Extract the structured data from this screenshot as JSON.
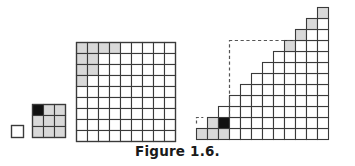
{
  "figure": {
    "caption": "Figure 1.6.",
    "background_color": "#ffffff",
    "line_color": "#3a3a3a",
    "shaded_color": "#d9d9d9",
    "black_color": "#111111",
    "empty_color": "#ffffff",
    "dashed_color": "#555555",
    "panels": [
      {
        "id": "panel-1",
        "name": "single-square-panel",
        "label": "n = 1",
        "type": "grid",
        "cols": 1,
        "rows": 1,
        "cell_px": 12,
        "origin_x": 11,
        "origin_y": 125,
        "shaded_cells": [],
        "black_cells": [],
        "cell_count": 1
      },
      {
        "id": "panel-2",
        "name": "three-by-three-grid-panel",
        "label": "n = 3",
        "type": "grid",
        "cols": 3,
        "rows": 3,
        "cell_px": 11,
        "origin_x": 32,
        "origin_y": 104,
        "shaded_cells": [
          [
            0,
            1
          ],
          [
            0,
            2
          ],
          [
            1,
            0
          ],
          [
            1,
            1
          ],
          [
            1,
            2
          ],
          [
            2,
            0
          ],
          [
            2,
            1
          ],
          [
            2,
            2
          ]
        ],
        "black_cells": [
          [
            0,
            0
          ]
        ],
        "cell_count": 9
      },
      {
        "id": "panel-3",
        "name": "nine-by-nine-grid-panel",
        "label": "n = 9",
        "type": "grid",
        "cols": 9,
        "rows": 9,
        "cell_px": 11,
        "origin_x": 76,
        "origin_y": 42,
        "shaded_cells": [
          [
            0,
            0
          ],
          [
            0,
            1
          ],
          [
            0,
            2
          ],
          [
            0,
            3
          ],
          [
            1,
            0
          ],
          [
            1,
            1
          ],
          [
            2,
            0
          ],
          [
            2,
            1
          ],
          [
            3,
            0
          ]
        ],
        "black_cells": [],
        "cell_count": 81
      },
      {
        "id": "panel-4",
        "name": "staircase-panel",
        "label": "staircase",
        "type": "staircase",
        "columns": 12,
        "cell_px": 11,
        "origin_x": 196,
        "origin_y_bottom": 139,
        "column_heights": [
          1,
          2,
          3,
          4,
          5,
          6,
          7,
          8,
          9,
          10,
          11,
          12
        ],
        "shaded_cells": [
          [
            0,
            0
          ],
          [
            1,
            0
          ],
          [
            1,
            1
          ],
          [
            2,
            0
          ],
          [
            8,
            8
          ],
          [
            9,
            9
          ],
          [
            10,
            10
          ],
          [
            11,
            11
          ]
        ],
        "black_cells": [
          [
            2,
            1
          ]
        ],
        "dashed_outline": {
          "name": "dashed-corner-outline",
          "vertical_x_col": 3,
          "vertical_from_row": 2,
          "vertical_to_row": 9,
          "horizontal_row": 9,
          "horizontal_from_col": 3,
          "horizontal_to_col": 9
        },
        "dashed_bracket": {
          "name": "dashed-small-bracket",
          "col": 0,
          "row": 2
        }
      }
    ]
  }
}
